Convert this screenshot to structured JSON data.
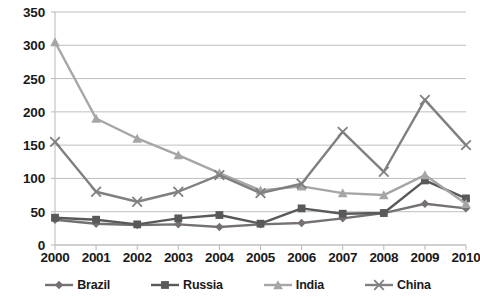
{
  "chart_data": {
    "type": "line",
    "title": "",
    "xlabel": "",
    "ylabel": "",
    "categories": [
      "2000",
      "2001",
      "2002",
      "2003",
      "2004",
      "2005",
      "2006",
      "2007",
      "2008",
      "2009",
      "2010"
    ],
    "ylim": [
      0,
      350
    ],
    "ytick_step": 50,
    "yticks": [
      "0",
      "50",
      "100",
      "150",
      "200",
      "250",
      "300",
      "350"
    ],
    "grid": true,
    "legend_position": "bottom",
    "series": [
      {
        "name": "Brazil",
        "marker": "diamond",
        "color": "#767171",
        "values": [
          38,
          32,
          30,
          31,
          27,
          31,
          33,
          40,
          48,
          62,
          55
        ]
      },
      {
        "name": "Russia",
        "marker": "square",
        "color": "#595959",
        "values": [
          41,
          38,
          31,
          40,
          45,
          32,
          55,
          47,
          48,
          97,
          70
        ]
      },
      {
        "name": "India",
        "marker": "triangle",
        "color": "#A6A6A6",
        "values": [
          305,
          190,
          160,
          135,
          108,
          82,
          88,
          78,
          75,
          105,
          62
        ]
      },
      {
        "name": "China",
        "marker": "x",
        "color": "#808080",
        "values": [
          155,
          80,
          65,
          80,
          105,
          78,
          92,
          170,
          110,
          218,
          150
        ]
      }
    ]
  },
  "axis": {
    "y_tick_labels": [
      "350",
      "300",
      "250",
      "200",
      "150",
      "100",
      "50",
      "0"
    ],
    "x_tick_labels": [
      "2000",
      "2001",
      "2002",
      "2003",
      "2004",
      "2005",
      "2006",
      "2007",
      "2008",
      "2009",
      "2010"
    ]
  },
  "legend": {
    "items": [
      {
        "label": "Brazil",
        "marker": "diamond-marker-icon",
        "color": "#767171"
      },
      {
        "label": "Russia",
        "marker": "square-marker-icon",
        "color": "#595959"
      },
      {
        "label": "India",
        "marker": "triangle-marker-icon",
        "color": "#A6A6A6"
      },
      {
        "label": "China",
        "marker": "x-marker-icon",
        "color": "#808080"
      }
    ]
  },
  "style": {
    "grid_color": "#BFBFBF",
    "axis_color": "#BFBFBF",
    "text_color": "#1a1a1a",
    "background": "#ffffff"
  }
}
